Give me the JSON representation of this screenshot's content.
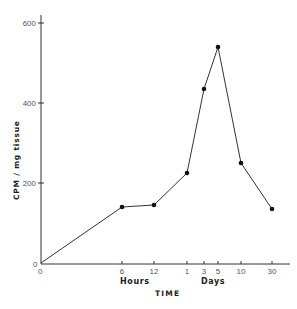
{
  "chart_data": {
    "type": "line",
    "title": "",
    "xlabel": "TIME",
    "ylabel": "CPM / mg tissue",
    "ylim": [
      0,
      600
    ],
    "yticks": [
      0,
      200,
      400,
      600
    ],
    "x_groups": [
      {
        "label": "Hours",
        "ticks": [
          "6",
          "12"
        ]
      },
      {
        "label": "Days",
        "ticks": [
          "1",
          "3",
          "5",
          "10",
          "30"
        ]
      }
    ],
    "categories": [
      "0",
      "6",
      "12",
      "1",
      "3",
      "5",
      "10",
      "30"
    ],
    "x_units": [
      "",
      "hours",
      "hours",
      "days",
      "days",
      "days",
      "days",
      "days"
    ],
    "series": [
      {
        "name": "CPM / mg tissue",
        "values": [
          0,
          140,
          145,
          225,
          435,
          540,
          250,
          135
        ]
      }
    ],
    "grid": false,
    "legend": null
  },
  "labels": {
    "origin_y": "0",
    "origin_x": "0",
    "hours": "Hours",
    "days": "Days",
    "time": "TIME",
    "ylabel": "CPM / mg tissue"
  }
}
